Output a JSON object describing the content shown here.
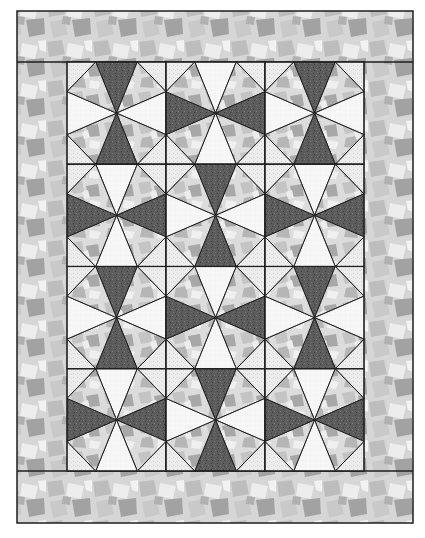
{
  "quilt": {
    "canvas": {
      "width": 425,
      "height": 538
    },
    "outer_border": {
      "x": 17,
      "y": 11,
      "width": 396,
      "height": 512
    },
    "center_panel": {
      "x": 67,
      "y": 62,
      "width": 297,
      "height": 409
    },
    "grid": {
      "cols": 3,
      "rows": 4,
      "vertex_ratio": 0.29
    },
    "block_layout": [
      [
        "V",
        "H",
        "V"
      ],
      [
        "H",
        "V",
        "H"
      ],
      [
        "V",
        "H",
        "V"
      ],
      [
        "H",
        "V",
        "H"
      ]
    ],
    "colors": {
      "background": "#ffffff",
      "outline": "#1e1e1e",
      "dark_wedge": "#5c5c5c",
      "dark_speck": "#3e3e3e",
      "white_wedge": "#f7f7f7",
      "print_base": "#dcdcdc",
      "print_patch_light": "#c4c4c4",
      "print_patch_dark": "#a8a8a8",
      "corner_base": "#ececec",
      "border_base": "#d6d6d6",
      "border_patch_light": "#bdbdbd",
      "border_patch_dark": "#a2a2a2",
      "border_highlight": "#f0f0f0"
    }
  }
}
